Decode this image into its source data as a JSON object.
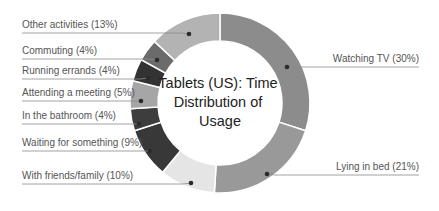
{
  "chart_data": {
    "type": "pie",
    "subtype": "donut",
    "title": "Tablets (US): Time Distribution of Usage",
    "title_lines": [
      "Tablets (US): Time",
      "Distribution of",
      "Usage"
    ],
    "start_angle": "top, clockwise",
    "unit": "%",
    "slices": [
      {
        "label": "Watching TV",
        "value": 30,
        "display": "Watching TV (30%)",
        "color": "#8c8c8c",
        "side": "right",
        "label_y": 62,
        "label_x_end": 419,
        "dot": [
          287,
          67
        ]
      },
      {
        "label": "Lying in bed",
        "value": 21,
        "display": "Lying in bed (21%)",
        "color": "#999999",
        "side": "right",
        "label_y": 170,
        "label_x_end": 419,
        "dot": [
          267,
          174
        ]
      },
      {
        "label": "With friends/family",
        "value": 10,
        "display": "With friends/family (10%)",
        "color": "#e5e5e5",
        "side": "left",
        "label_y": 179,
        "label_x_start": 22,
        "dot": [
          191,
          183
        ]
      },
      {
        "label": "Waiting for something",
        "value": 9,
        "display": "Waiting for something (9%)",
        "color": "#383838",
        "side": "left",
        "label_y": 146,
        "label_x_start": 22,
        "dot": [
          150,
          151
        ]
      },
      {
        "label": "In the bathroom",
        "value": 4,
        "display": "In the bathroom (4%)",
        "color": "#3d3d3d",
        "side": "left",
        "label_y": 119,
        "label_x_start": 22,
        "dot": [
          139,
          124
        ]
      },
      {
        "label": "Attending a meeting",
        "value": 5,
        "display": "Attending a meeting (5%)",
        "color": "#a6a6a6",
        "side": "left",
        "label_y": 96,
        "label_x_start": 22,
        "dot": [
          141,
          101
        ]
      },
      {
        "label": "Running errands",
        "value": 4,
        "display": "Running errands (4%)",
        "color": "#333333",
        "side": "left",
        "label_y": 74,
        "label_x_start": 22,
        "dot": [
          148,
          78
        ]
      },
      {
        "label": "Commuting",
        "value": 4,
        "display": "Commuting (4%)",
        "color": "#6b6b6b",
        "side": "left",
        "label_y": 54,
        "label_x_start": 22,
        "dot": [
          157,
          60
        ]
      },
      {
        "label": "Other activities",
        "value": 13,
        "display": "Other activities (13%)",
        "color": "#b3b3b3",
        "side": "left",
        "label_y": 28,
        "label_x_start": 22,
        "dot": [
          189,
          34
        ]
      }
    ],
    "legend": "leader-line labels",
    "geometry": {
      "cx": 220,
      "cy": 103,
      "outer_r": 90,
      "inner_r": 62
    }
  }
}
